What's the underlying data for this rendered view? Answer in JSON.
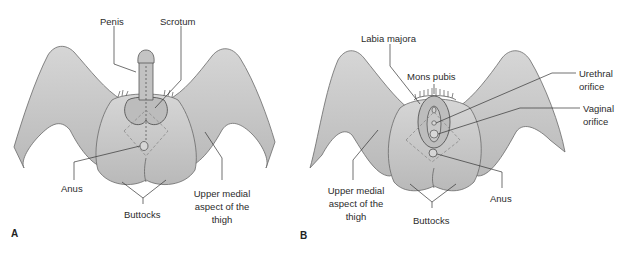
{
  "colors": {
    "skin": "#c9c9c9",
    "skin_dark": "#a8a8a8",
    "outline": "#555555",
    "leader": "#333333",
    "dashed": "#8a8a8a",
    "text": "#2b2b2b",
    "background": "#ffffff"
  },
  "panel_a": {
    "letter": "A",
    "labels": {
      "penis": "Penis",
      "scrotum": "Scrotum",
      "anus": "Anus",
      "buttocks": "Buttocks",
      "thigh_line1": "Upper medial",
      "thigh_line2": "aspect of the",
      "thigh_line3": "thigh"
    }
  },
  "panel_b": {
    "letter": "B",
    "labels": {
      "labia_majora": "Labia majora",
      "mons_pubis": "Mons pubis",
      "urethral_line1": "Urethral",
      "urethral_line2": "orifice",
      "vaginal_line1": "Vaginal",
      "vaginal_line2": "orifice",
      "anus": "Anus",
      "buttocks": "Buttocks",
      "thigh_line1": "Upper medial",
      "thigh_line2": "aspect of the",
      "thigh_line3": "thigh"
    }
  }
}
